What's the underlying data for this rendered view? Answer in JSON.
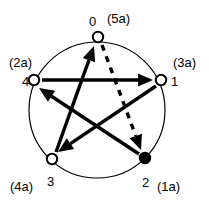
{
  "figure": {
    "name": "directed-pentagon-star-graph",
    "background_color": "#ffffff",
    "stroke_color": "#000000",
    "circle": {
      "cx": 97,
      "cy": 110,
      "r": 68,
      "stroke_width": 1.2
    }
  },
  "nodes": [
    {
      "id": "0",
      "label": "0",
      "alias": "(5a)",
      "x": 98,
      "y": 37,
      "radius": 5.2,
      "filled": false,
      "label_pos": {
        "x": 89,
        "y": 15
      },
      "alias_pos": {
        "x": 107,
        "y": 12
      }
    },
    {
      "id": "1",
      "label": "1",
      "alias": "(3a)",
      "x": 161,
      "y": 80,
      "radius": 5.2,
      "filled": false,
      "label_pos": {
        "x": 171,
        "y": 75
      },
      "alias_pos": {
        "x": 173,
        "y": 56
      }
    },
    {
      "id": "2",
      "label": "2",
      "alias": "(1a)",
      "x": 145,
      "y": 158,
      "radius": 5.2,
      "filled": true,
      "label_pos": {
        "x": 142,
        "y": 176
      },
      "alias_pos": {
        "x": 157,
        "y": 180
      }
    },
    {
      "id": "3",
      "label": "3",
      "alias": "(4a)",
      "x": 52,
      "y": 159,
      "radius": 5.2,
      "filled": false,
      "label_pos": {
        "x": 47,
        "y": 175
      },
      "alias_pos": {
        "x": 10,
        "y": 180
      }
    },
    {
      "id": "4",
      "label": "4",
      "alias": "(2a)",
      "x": 34,
      "y": 80,
      "radius": 5.2,
      "filled": false,
      "label_pos": {
        "x": 22,
        "y": 75
      },
      "alias_pos": {
        "x": 9,
        "y": 56
      }
    }
  ],
  "edges": [
    {
      "name": "edge-4-to-1",
      "from": "4",
      "to": "1",
      "style": "solid",
      "x1": 42,
      "y1": 80,
      "x2": 153,
      "y2": 80,
      "stroke_width": 3.4
    },
    {
      "name": "edge-3-to-0",
      "from": "3",
      "to": "0",
      "style": "solid",
      "x1": 56,
      "y1": 152,
      "x2": 94,
      "y2": 46,
      "stroke_width": 3.4
    },
    {
      "name": "edge-0-to-2",
      "from": "0",
      "to": "2",
      "style": "dashed",
      "x1": 102,
      "y1": 45,
      "x2": 141,
      "y2": 150,
      "stroke_width": 3.4,
      "dash_pattern": "6 6"
    },
    {
      "name": "edge-2-to-4",
      "from": "2",
      "to": "4",
      "style": "solid",
      "x1": 139,
      "y1": 154,
      "x2": 39,
      "y2": 88,
      "stroke_width": 3.4
    },
    {
      "name": "edge-1-to-3",
      "from": "1",
      "to": "3",
      "style": "solid",
      "x1": 156,
      "y1": 86,
      "x2": 58,
      "y2": 152,
      "stroke_width": 3.4
    }
  ]
}
